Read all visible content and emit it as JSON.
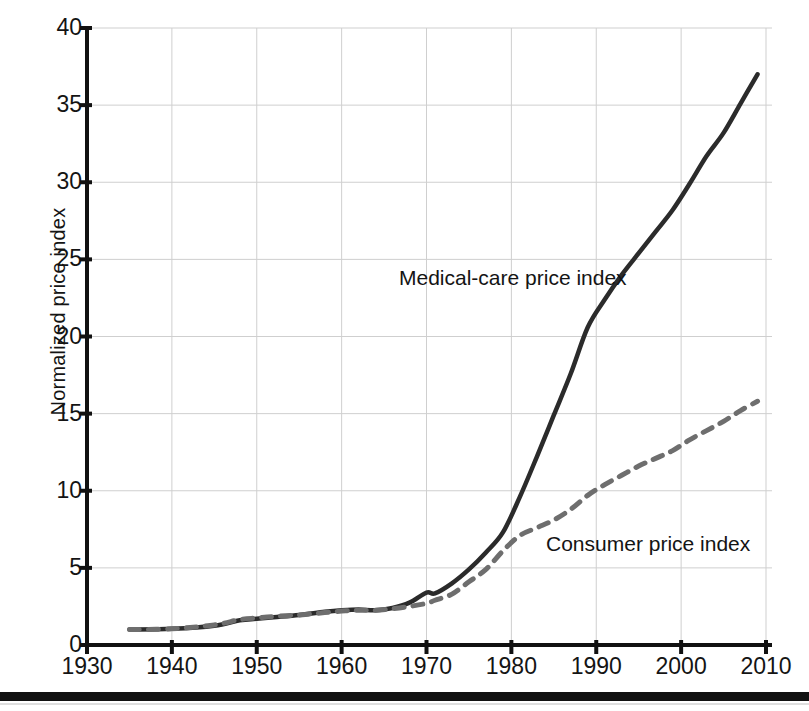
{
  "chart_data": {
    "type": "line",
    "title": "",
    "xlabel": "",
    "ylabel": "Normalized price index",
    "xlim": [
      1930,
      2010
    ],
    "ylim": [
      0,
      40
    ],
    "grid": true,
    "legend_position": "inline-annotations",
    "xticks": [
      1930,
      1940,
      1950,
      1960,
      1970,
      1980,
      1990,
      2000,
      2010
    ],
    "yticks": [
      0,
      5,
      10,
      15,
      20,
      25,
      30,
      35,
      40
    ],
    "series": [
      {
        "name": "Medical-care price index",
        "style": "solid",
        "color": "#2b2b2b",
        "x": [
          1935,
          1940,
          1945,
          1948,
          1950,
          1952,
          1955,
          1958,
          1960,
          1962,
          1964,
          1966,
          1968,
          1970,
          1971,
          1973,
          1975,
          1977,
          1979,
          1981,
          1983,
          1985,
          1987,
          1989,
          1991,
          1993,
          1995,
          1997,
          1999,
          2001,
          2003,
          2005,
          2007,
          2009
        ],
        "y": [
          1.0,
          1.05,
          1.25,
          1.6,
          1.7,
          1.8,
          1.95,
          2.15,
          2.25,
          2.3,
          2.25,
          2.4,
          2.75,
          3.4,
          3.35,
          4.0,
          4.9,
          6.0,
          7.3,
          9.6,
          12.2,
          14.9,
          17.6,
          20.6,
          22.4,
          24.0,
          25.4,
          26.8,
          28.2,
          29.9,
          31.7,
          33.2,
          35.1,
          37.0
        ]
      },
      {
        "name": "Consumer price index",
        "style": "dashed",
        "color": "#6e6e6e",
        "x": [
          1935,
          1940,
          1945,
          1948,
          1950,
          1952,
          1955,
          1958,
          1960,
          1962,
          1964,
          1966,
          1968,
          1970,
          1971,
          1973,
          1975,
          1977,
          1979,
          1981,
          1983,
          1985,
          1987,
          1989,
          1991,
          1993,
          1995,
          1997,
          1999,
          2001,
          2003,
          2005,
          2007,
          2009
        ],
        "y": [
          1.0,
          1.05,
          1.3,
          1.65,
          1.75,
          1.85,
          1.95,
          2.1,
          2.2,
          2.25,
          2.25,
          2.35,
          2.5,
          2.7,
          2.9,
          3.3,
          4.1,
          4.9,
          6.1,
          7.1,
          7.6,
          8.1,
          8.8,
          9.7,
          10.4,
          11.0,
          11.6,
          12.1,
          12.6,
          13.3,
          13.9,
          14.5,
          15.2,
          15.8
        ]
      }
    ],
    "annotations": [
      {
        "text": "Medical-care price index",
        "series": "Medical-care price index"
      },
      {
        "text": "Consumer price index",
        "series": "Consumer price index"
      }
    ]
  }
}
